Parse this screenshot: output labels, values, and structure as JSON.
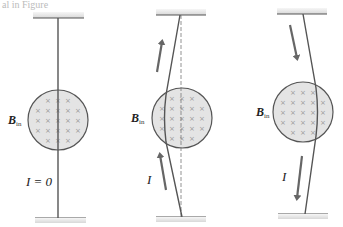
{
  "figure": {
    "header_fragment": "al in Figure",
    "field_symbol": "B",
    "field_subscript": "in",
    "current_symbol": "I",
    "colors": {
      "wire": "#555555",
      "field_fill": "#e4e4e4",
      "arrow": "#666666",
      "field_mark": "#999999"
    },
    "panels": [
      {
        "id": "no-current",
        "current_label": "I = 0",
        "current_direction": "none",
        "wire_deflection": "none"
      },
      {
        "id": "current-up",
        "current_label": "I",
        "current_direction": "up",
        "wire_deflection": "left",
        "reference_line": "dashed"
      },
      {
        "id": "current-down",
        "current_label": "I",
        "current_direction": "down",
        "wire_deflection": "right"
      }
    ],
    "field_marks_per_circle": "× (into page)"
  }
}
